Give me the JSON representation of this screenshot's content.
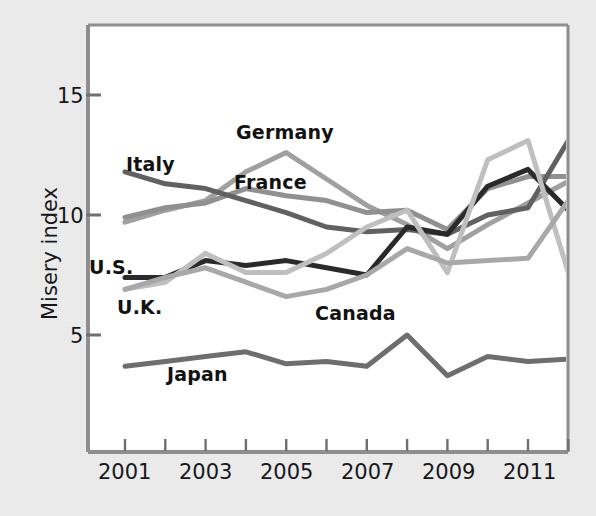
{
  "figure": {
    "y_axis_title": "Misery index",
    "y_ticks": [
      5,
      10,
      15
    ],
    "x_ticks_labeled": [
      "2001",
      "2003",
      "2005",
      "2007",
      "2009",
      "2011"
    ],
    "plot_bg": "#ffffff",
    "frame_color": "#8e8e90"
  },
  "series_labels": {
    "germany": "Germany",
    "france": "France",
    "italy": "Italy",
    "us": "U.S.",
    "uk": "U.K.",
    "canada": "Canada",
    "japan": "Japan"
  },
  "chart_data": {
    "type": "line",
    "title": "",
    "xlabel": "",
    "ylabel": "Misery index",
    "x": [
      2001,
      2002,
      2003,
      2004,
      2005,
      2006,
      2007,
      2008,
      2009,
      2010,
      2011,
      2012
    ],
    "xlim": [
      2001,
      2012
    ],
    "ylim": [
      2.0,
      17.5
    ],
    "yticks": [
      5,
      10,
      15
    ],
    "xticks": [
      2001,
      2002,
      2003,
      2004,
      2005,
      2006,
      2007,
      2008,
      2009,
      2010,
      2011,
      2012
    ],
    "xticklabels": [
      "2001",
      "",
      "2003",
      "",
      "2005",
      "",
      "2007",
      "",
      "2009",
      "",
      "2011",
      ""
    ],
    "grid": false,
    "legend": "inline-labels",
    "series": [
      {
        "name": "Germany",
        "color": "#a0a0a0",
        "width": 5,
        "values": [
          9.7,
          10.2,
          10.6,
          11.8,
          12.6,
          11.5,
          10.4,
          9.6,
          8.6,
          9.6,
          10.5,
          11.4
        ]
      },
      {
        "name": "France",
        "color": "#909090",
        "width": 5,
        "values": [
          9.9,
          10.3,
          10.5,
          11.1,
          10.8,
          10.6,
          10.1,
          10.2,
          9.4,
          11.1,
          11.6,
          11.6
        ]
      },
      {
        "name": "Italy",
        "color": "#616163",
        "width": 5,
        "values": [
          11.8,
          11.3,
          11.1,
          10.6,
          10.1,
          9.5,
          9.3,
          9.4,
          9.2,
          10.0,
          10.3,
          13.1
        ]
      },
      {
        "name": "U.S.",
        "color": "#2a2a2c",
        "width": 5,
        "values": [
          7.4,
          7.4,
          8.1,
          7.9,
          8.1,
          7.8,
          7.5,
          9.5,
          9.2,
          11.2,
          11.9,
          10.2
        ]
      },
      {
        "name": "U.K.",
        "color": "#bfbfbf",
        "width": 5,
        "values": [
          6.9,
          7.2,
          8.4,
          7.6,
          7.6,
          8.4,
          9.5,
          10.2,
          7.6,
          12.3,
          13.1,
          7.6
        ]
      },
      {
        "name": "Canada",
        "color": "#a8a8a8",
        "width": 5,
        "values": [
          6.9,
          7.4,
          7.8,
          7.2,
          6.6,
          6.9,
          7.5,
          8.6,
          8.0,
          8.1,
          8.2,
          10.6
        ]
      },
      {
        "name": "Japan",
        "color": "#6e6e70",
        "width": 5,
        "values": [
          3.7,
          3.9,
          4.1,
          4.3,
          3.8,
          3.9,
          3.7,
          5.0,
          3.3,
          4.1,
          3.9,
          4.0
        ]
      }
    ]
  },
  "annotations": [
    {
      "text": "Germany",
      "x": 236,
      "y": 121
    },
    {
      "text": "France",
      "x": 234,
      "y": 171
    },
    {
      "text": "Italy",
      "x": 126,
      "y": 153
    },
    {
      "text": "U.S.",
      "x": 89,
      "y": 256
    },
    {
      "text": "U.K.",
      "x": 117,
      "y": 296
    },
    {
      "text": "Canada",
      "x": 315,
      "y": 302
    },
    {
      "text": "Japan",
      "x": 167,
      "y": 363
    }
  ]
}
